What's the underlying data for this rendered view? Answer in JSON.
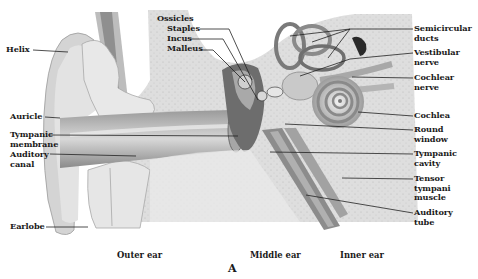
{
  "figure": {
    "panel_letter": "A",
    "regions": [
      {
        "id": "outer",
        "label": "Outer ear"
      },
      {
        "id": "middle",
        "label": "Middle ear"
      },
      {
        "id": "inner",
        "label": "Inner ear"
      }
    ],
    "labels_left": [
      {
        "id": "helix",
        "line1": "Helix",
        "line2": ""
      },
      {
        "id": "auricle",
        "line1": "Auricle",
        "line2": ""
      },
      {
        "id": "tympanic-membrane",
        "line1": "Tympanic",
        "line2": "membrane"
      },
      {
        "id": "auditory-canal",
        "line1": "Auditory",
        "line2": "canal"
      },
      {
        "id": "earlobe",
        "line1": "Earlobe",
        "line2": ""
      }
    ],
    "labels_top": {
      "group": "Ossicles",
      "items": [
        {
          "id": "staples",
          "label": "Staples"
        },
        {
          "id": "incus",
          "label": "Incus"
        },
        {
          "id": "malleus",
          "label": "Malleus"
        }
      ]
    },
    "labels_right": [
      {
        "id": "semicircular-ducts",
        "line1": "Semicircular",
        "line2": "ducts",
        "line3": ""
      },
      {
        "id": "vestibular-nerve",
        "line1": "Vestibular",
        "line2": "nerve",
        "line3": ""
      },
      {
        "id": "cochlear-nerve",
        "line1": "Cochlear",
        "line2": "nerve",
        "line3": ""
      },
      {
        "id": "cochlea",
        "line1": "Cochlea",
        "line2": "",
        "line3": ""
      },
      {
        "id": "round-window",
        "line1": "Round",
        "line2": "window",
        "line3": ""
      },
      {
        "id": "tympanic-cavity",
        "line1": "Tympanic",
        "line2": "cavity",
        "line3": ""
      },
      {
        "id": "tensor-tympani",
        "line1": "Tensor",
        "line2": "tympani",
        "line3": "muscle"
      },
      {
        "id": "auditory-tube",
        "line1": "Auditory",
        "line2": "tube",
        "line3": ""
      }
    ],
    "colors": {
      "background": "#ffffff",
      "tissue_light": "#e6e6e6",
      "tissue_mid": "#c4c4c4",
      "tissue_dark": "#5a5a5a",
      "label_text": "#1a1a1a",
      "leader_line": "#222222"
    }
  }
}
